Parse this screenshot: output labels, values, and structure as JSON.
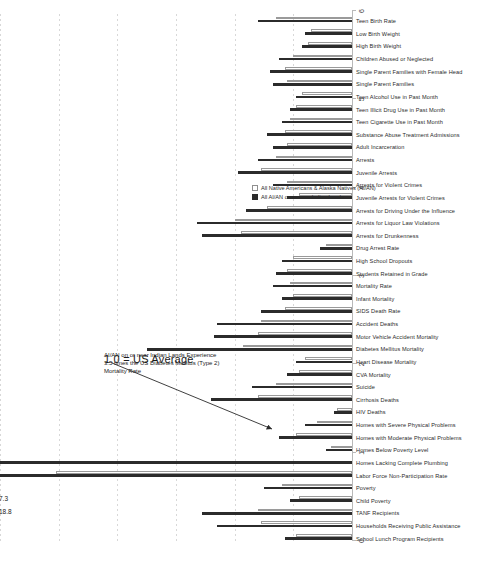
{
  "chart_data": {
    "type": "bar",
    "title": "",
    "xlabel": "",
    "ylabel": "",
    "xlim": [
      0,
      6
    ],
    "ylim": [
      0,
      6
    ],
    "grid": true,
    "orientation": "vertical-rotated",
    "legend_position": "right",
    "axis_ticks": [
      "0",
      "1",
      "2",
      "3",
      "4",
      "5",
      "6"
    ],
    "reference_note": "1.0 = US Average",
    "annotation": "AI/AN on or near Indian Lands Experience 3.5 times the US Diabetes Mellitus (Type 2) Mortality Rate",
    "categories": [
      "School Lunch Program Recipients",
      "Households Receiving Public Assistance",
      "TANF Recipients",
      "Child Poverty",
      "Poverty",
      "Labor Force Non-Participation Rate",
      "Homes Lacking Complete Plumbing",
      "Homes Below Poverty Level",
      "Homes with Moderate Physical Problems",
      "Homes with Severe Physical Problems",
      "HIV Deaths",
      "Cirrhosis Deaths",
      "Suicide",
      "CVA Mortality",
      "Heart Disease Mortality",
      "Diabetes Mellitus Mortality",
      "Motor Vehicle Accident Mortality",
      "Accident Deaths",
      "SIDS Death Rate",
      "Infant Mortality",
      "Mortality Rate",
      "Students Retained in Grade",
      "High School Dropouts",
      "Drug Arrest Rate",
      "Arrests for Drunkenness",
      "Arrests for Liquor Law Violations",
      "Arrests for Driving Under the Influence",
      "Juvenile Arrests for Violent Crimes",
      "Arrests for Violent Crimes",
      "Juvenile Arrests",
      "Arrests",
      "Adult Incarceration",
      "Substance Abuse Treatment Admissions",
      "Teen Cigarette Use in Past Month",
      "Teen Illicit Drug Use in Past Month",
      "Teen Alcohol Use in Past Month",
      "Single Parent Families",
      "Single Parent Families with Female Head",
      "Children Abused or Neglected",
      "High Birth Weight",
      "Low Birth Weight",
      "Teen Birth Rate"
    ],
    "series": [
      {
        "name": "All AI/AN on or near Indian Lands",
        "color": "#2b2b2b",
        "values": [
          1.15,
          2.3,
          2.55,
          1.05,
          1.5,
          18.8,
          7.3,
          0.45,
          1.25,
          0.8,
          0.3,
          2.4,
          1.7,
          1.1,
          0.95,
          3.5,
          2.35,
          2.3,
          1.55,
          1.2,
          1.35,
          1.3,
          1.2,
          0.55,
          2.55,
          2.65,
          1.8,
          1.1,
          1.35,
          1.95,
          1.6,
          1.35,
          1.45,
          1.2,
          1.05,
          0.95,
          1.35,
          1.4,
          1.25,
          0.85,
          0.8,
          1.6
        ],
        "labeled_values": {
          "5": "18.8",
          "6": "7.3"
        }
      },
      {
        "name": "All Native Americans & Alaska Natives (AI/AN)",
        "color": "#ffffff",
        "values": [
          0.95,
          1.55,
          1.6,
          0.9,
          1.2,
          5.05,
          0.0,
          0.35,
          0.95,
          0.6,
          0.25,
          1.6,
          1.3,
          0.9,
          0.8,
          1.85,
          1.6,
          1.55,
          1.15,
          1.0,
          1.05,
          1.1,
          1.0,
          0.45,
          1.9,
          2.0,
          1.45,
          0.9,
          1.1,
          1.55,
          1.3,
          1.1,
          1.15,
          1.05,
          0.95,
          0.85,
          1.1,
          1.15,
          1.0,
          0.75,
          0.7,
          1.3
        ]
      }
    ]
  },
  "legend": {
    "items": [
      {
        "label": "All Native Americans & Alaska Natives (AI/AN)",
        "swatch": "allr"
      },
      {
        "label": "All AI/AN on or near Indian Lands",
        "swatch": "aian"
      }
    ]
  }
}
